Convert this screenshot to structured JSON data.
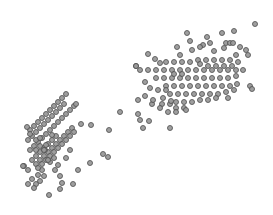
{
  "chart_data": {
    "type": "scatter",
    "title": "",
    "xlabel": "",
    "ylabel": "",
    "axes_visible": false,
    "grid": false,
    "legend": null,
    "marker": {
      "shape": "circle",
      "radius": 2.5,
      "fill": "#9a9a9a",
      "stroke": "#505050"
    },
    "coordinate_space": "pixel (x right, y down), 273x215 canvas",
    "series": [
      {
        "name": "cluster-lower-left",
        "points": [
          [
            24,
            166
          ],
          [
            28,
            170
          ],
          [
            32,
            179
          ],
          [
            36,
            184
          ],
          [
            40,
            181
          ],
          [
            44,
            176
          ],
          [
            28,
            184
          ],
          [
            34,
            188
          ],
          [
            38,
            175
          ],
          [
            42,
            170
          ],
          [
            32,
            160
          ],
          [
            36,
            156
          ],
          [
            40,
            152
          ],
          [
            44,
            148
          ],
          [
            48,
            144
          ],
          [
            52,
            140
          ],
          [
            56,
            136
          ],
          [
            30,
            150
          ],
          [
            34,
            146
          ],
          [
            38,
            142
          ],
          [
            42,
            138
          ],
          [
            46,
            134
          ],
          [
            50,
            130
          ],
          [
            54,
            126
          ],
          [
            58,
            122
          ],
          [
            62,
            118
          ],
          [
            66,
            114
          ],
          [
            70,
            110
          ],
          [
            74,
            106
          ],
          [
            76,
            104
          ],
          [
            28,
            140
          ],
          [
            32,
            136
          ],
          [
            36,
            132
          ],
          [
            40,
            128
          ],
          [
            44,
            124
          ],
          [
            48,
            120
          ],
          [
            52,
            116
          ],
          [
            56,
            112
          ],
          [
            60,
            108
          ],
          [
            64,
            104
          ],
          [
            30,
            130
          ],
          [
            34,
            126
          ],
          [
            38,
            122
          ],
          [
            42,
            118
          ],
          [
            46,
            114
          ],
          [
            50,
            110
          ],
          [
            54,
            106
          ],
          [
            58,
            102
          ],
          [
            62,
            98
          ],
          [
            66,
            94
          ],
          [
            36,
            164
          ],
          [
            40,
            160
          ],
          [
            44,
            156
          ],
          [
            48,
            152
          ],
          [
            52,
            148
          ],
          [
            56,
            144
          ],
          [
            60,
            140
          ],
          [
            64,
            136
          ],
          [
            68,
            132
          ],
          [
            72,
            128
          ],
          [
            38,
            168
          ],
          [
            42,
            164
          ],
          [
            46,
            160
          ],
          [
            50,
            156
          ],
          [
            54,
            152
          ],
          [
            58,
            148
          ],
          [
            62,
            144
          ],
          [
            66,
            140
          ],
          [
            70,
            136
          ],
          [
            74,
            132
          ],
          [
            27,
            127
          ],
          [
            30,
            134
          ],
          [
            36,
            140
          ],
          [
            40,
            146
          ],
          [
            45,
            150
          ],
          [
            50,
            162
          ],
          [
            55,
            170
          ],
          [
            60,
            176
          ],
          [
            62,
            183
          ],
          [
            49,
            195
          ],
          [
            23,
            166
          ],
          [
            91,
            125
          ],
          [
            90,
            163
          ],
          [
            103,
            154
          ],
          [
            108,
            157
          ],
          [
            109,
            130
          ],
          [
            81,
            124
          ],
          [
            78,
            170
          ],
          [
            73,
            184
          ],
          [
            60,
            189
          ],
          [
            44,
            150
          ],
          [
            48,
            160
          ],
          [
            52,
            135
          ],
          [
            46,
            145
          ],
          [
            36,
            150
          ],
          [
            40,
            138
          ],
          [
            54,
            158
          ],
          [
            58,
            165
          ],
          [
            66,
            158
          ],
          [
            70,
            150
          ]
        ]
      },
      {
        "name": "cluster-upper-right",
        "points": [
          [
            255,
            24
          ],
          [
            234,
            31
          ],
          [
            222,
            33
          ],
          [
            187,
            33
          ],
          [
            207,
            37
          ],
          [
            190,
            41
          ],
          [
            177,
            47
          ],
          [
            203,
            45
          ],
          [
            210,
            43
          ],
          [
            226,
            43
          ],
          [
            230,
            43
          ],
          [
            233,
            43
          ],
          [
            240,
            47
          ],
          [
            246,
            50
          ],
          [
            248,
            55
          ],
          [
            236,
            55
          ],
          [
            224,
            48
          ],
          [
            214,
            51
          ],
          [
            200,
            47
          ],
          [
            192,
            50
          ],
          [
            180,
            55
          ],
          [
            148,
            54
          ],
          [
            155,
            59
          ],
          [
            160,
            63
          ],
          [
            166,
            62
          ],
          [
            174,
            62
          ],
          [
            182,
            62
          ],
          [
            190,
            62
          ],
          [
            198,
            60
          ],
          [
            206,
            60
          ],
          [
            214,
            60
          ],
          [
            222,
            60
          ],
          [
            230,
            60
          ],
          [
            238,
            62
          ],
          [
            243,
            70
          ],
          [
            236,
            70
          ],
          [
            228,
            70
          ],
          [
            220,
            70
          ],
          [
            212,
            70
          ],
          [
            204,
            70
          ],
          [
            196,
            70
          ],
          [
            188,
            70
          ],
          [
            180,
            70
          ],
          [
            172,
            70
          ],
          [
            164,
            70
          ],
          [
            156,
            70
          ],
          [
            148,
            70
          ],
          [
            140,
            70
          ],
          [
            136,
            66
          ],
          [
            156,
            78
          ],
          [
            164,
            78
          ],
          [
            172,
            78
          ],
          [
            180,
            78
          ],
          [
            188,
            78
          ],
          [
            196,
            78
          ],
          [
            204,
            78
          ],
          [
            212,
            78
          ],
          [
            220,
            78
          ],
          [
            228,
            78
          ],
          [
            236,
            76
          ],
          [
            166,
            86
          ],
          [
            174,
            86
          ],
          [
            182,
            86
          ],
          [
            190,
            86
          ],
          [
            198,
            86
          ],
          [
            206,
            86
          ],
          [
            214,
            86
          ],
          [
            222,
            86
          ],
          [
            230,
            86
          ],
          [
            237,
            84
          ],
          [
            170,
            94
          ],
          [
            178,
            94
          ],
          [
            186,
            94
          ],
          [
            194,
            94
          ],
          [
            202,
            94
          ],
          [
            210,
            94
          ],
          [
            218,
            94
          ],
          [
            226,
            92
          ],
          [
            234,
            90
          ],
          [
            250,
            86
          ],
          [
            176,
            102
          ],
          [
            184,
            102
          ],
          [
            192,
            102
          ],
          [
            200,
            100
          ],
          [
            208,
            100
          ],
          [
            216,
            98
          ],
          [
            228,
            98
          ],
          [
            252,
            89
          ],
          [
            162,
            104
          ],
          [
            170,
            104
          ],
          [
            176,
            108
          ],
          [
            184,
            108
          ],
          [
            186,
            110
          ],
          [
            176,
            112
          ],
          [
            168,
            112
          ],
          [
            160,
            108
          ],
          [
            152,
            104
          ],
          [
            138,
            100
          ],
          [
            145,
            96
          ],
          [
            153,
            100
          ],
          [
            163,
            98
          ],
          [
            171,
            101
          ],
          [
            120,
            112
          ],
          [
            138,
            114
          ],
          [
            140,
            120
          ],
          [
            143,
            128
          ],
          [
            149,
            121
          ],
          [
            170,
            128
          ],
          [
            136,
            66
          ],
          [
            145,
            82
          ],
          [
            150,
            88
          ],
          [
            158,
            90
          ],
          [
            166,
            90
          ],
          [
            174,
            74
          ],
          [
            182,
            74
          ],
          [
            200,
            64
          ],
          [
            208,
            66
          ],
          [
            216,
            66
          ],
          [
            224,
            66
          ],
          [
            232,
            66
          ]
        ]
      }
    ]
  }
}
